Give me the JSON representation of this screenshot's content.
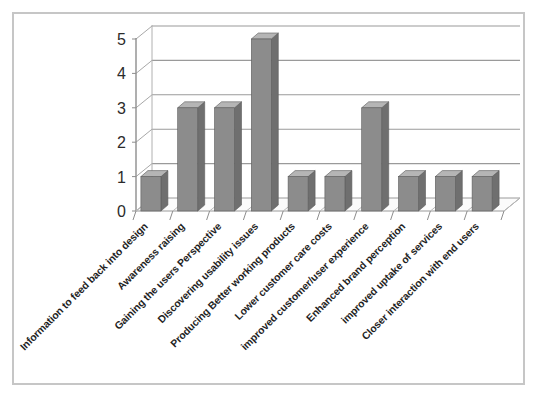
{
  "figure": {
    "background_color": "#ffffff",
    "border_color": "#c6c6c6"
  },
  "chart_data": {
    "type": "bar",
    "title": "",
    "subtitle": "",
    "xlabel": "",
    "ylabel": "",
    "ylim": [
      0,
      5
    ],
    "yticks": [
      "0",
      "1",
      "2",
      "3",
      "4",
      "5"
    ],
    "grid": true,
    "legend": false,
    "legend_position": "none",
    "style": "3d-column",
    "bar_color": "#8c8c8c",
    "bar_top_color": "#b5b5b5",
    "bar_side_color": "#6f6f6f",
    "gridline_color": "#9a9a9a",
    "categories": [
      "Information to feed back into design",
      "Awareness raising",
      "Gaining the users Perspective",
      "Discovering usability issues",
      "Producing Better working products",
      "Lower customer care costs",
      "improved customer/user experience",
      "Enhanced brand perception",
      "improved uptake of services",
      "Closer interaction with end users"
    ],
    "values": [
      1,
      3,
      3,
      5,
      1,
      1,
      3,
      1,
      1,
      1
    ]
  }
}
